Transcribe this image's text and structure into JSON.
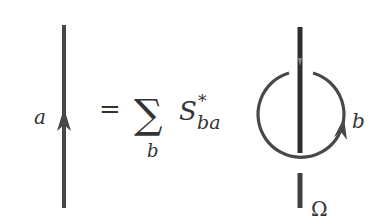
{
  "diagram": {
    "type": "anyon-diagram-equation",
    "stroke_color": "#444444",
    "left_strand": {
      "label": "a",
      "orientation": "up"
    },
    "equals": "=",
    "sum": {
      "symbol": "∑",
      "index": "b"
    },
    "coefficient": {
      "base": "S",
      "superscript": "*",
      "subscript": "ba"
    },
    "right_diagram": {
      "vertical_strand": "thick",
      "loop_label": "b",
      "loop_orientation": "counterclockwise",
      "stub_label": "Ω"
    }
  }
}
